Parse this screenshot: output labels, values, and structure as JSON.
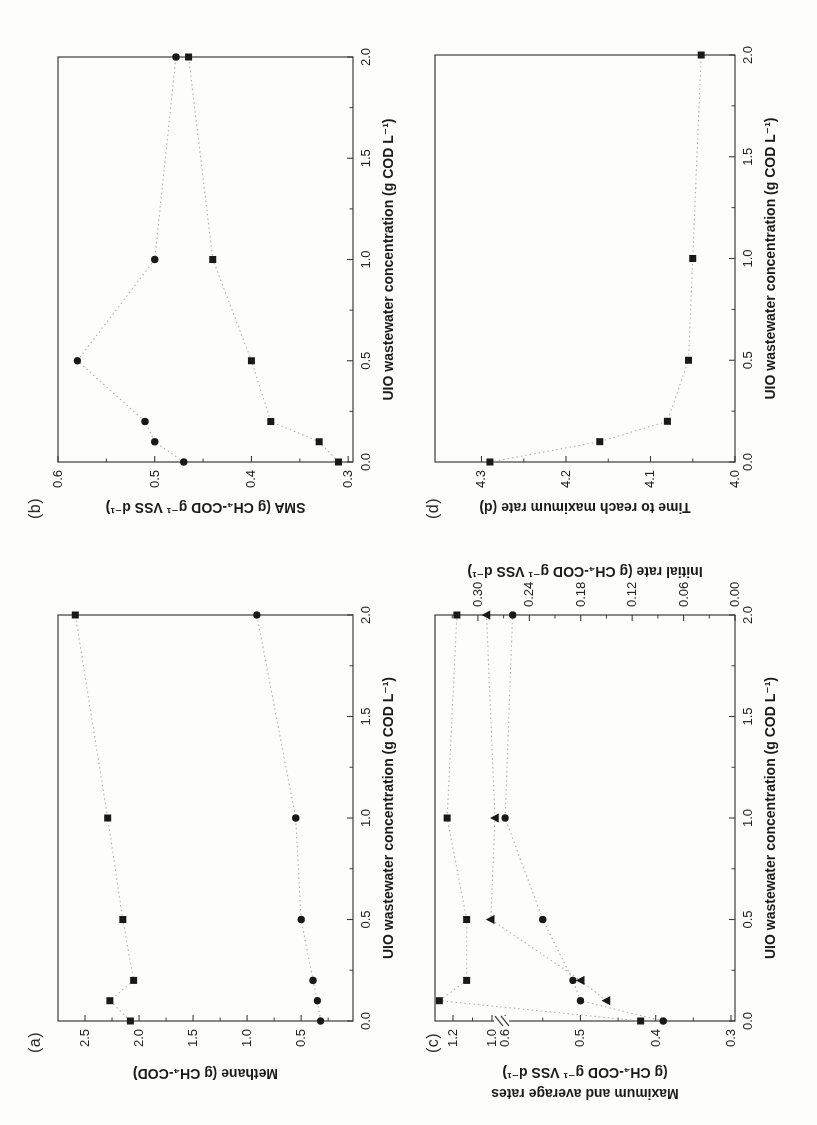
{
  "figure": {
    "kind": "scanned four-panel scatter figure, rotated 90 degrees on page",
    "ink_color": "#1f1f1f",
    "frame_color": "#3c3c3c",
    "trend_color": "#aeaeae"
  },
  "chart_data": [
    {
      "panel_label": "(a)",
      "type": "scatter",
      "xlabel": "UIO wastewater concentration (g COD L⁻¹)",
      "ylabel": "Methane (g CH₄-COD)",
      "xlim": [
        0.0,
        2.0
      ],
      "ylim": [
        0.02,
        2.75
      ],
      "grid": false,
      "legend": "none",
      "x_ticks": {
        "values": [
          0.0,
          0.5,
          1.0,
          1.5,
          2.0
        ],
        "labels": [
          "0.0",
          "0.5",
          "1.0",
          "1.5",
          "2.0"
        ],
        "minor": [
          0.25,
          0.75,
          1.25,
          1.75
        ]
      },
      "y_ticks": {
        "values": [
          0.5,
          1.0,
          1.5,
          2.0,
          2.5
        ],
        "labels": [
          "0.5",
          "1.0",
          "1.5",
          "2.0",
          "2.5"
        ],
        "minor": [
          0.25,
          0.75,
          1.25,
          1.75,
          2.25
        ]
      },
      "series": [
        {
          "name": "filled squares",
          "marker": "square",
          "axis": "left",
          "trend": "dotted",
          "x": [
            0.0,
            0.1,
            0.2,
            0.5,
            1.0,
            2.0
          ],
          "y": [
            2.08,
            2.27,
            2.05,
            2.15,
            2.29,
            2.59
          ]
        },
        {
          "name": "filled circles",
          "marker": "circle",
          "axis": "left",
          "trend": "dotted",
          "x": [
            0.0,
            0.1,
            0.2,
            0.5,
            1.0,
            2.0
          ],
          "y": [
            0.32,
            0.35,
            0.39,
            0.5,
            0.55,
            0.91
          ]
        }
      ]
    },
    {
      "panel_label": "(b)",
      "type": "scatter",
      "xlabel": "UIO wastewater concentration (g COD L⁻¹)",
      "ylabel": "SMA (g CH₄-COD g⁻¹ VSS d⁻¹)",
      "xlim": [
        0.0,
        2.0
      ],
      "ylim": [
        0.295,
        0.6
      ],
      "grid": false,
      "legend": "none",
      "x_ticks": {
        "values": [
          0.0,
          0.5,
          1.0,
          1.5,
          2.0
        ],
        "labels": [
          "0.0",
          "0.5",
          "1.0",
          "1.5",
          "2.0"
        ],
        "minor": [
          0.25,
          0.75,
          1.25,
          1.75
        ]
      },
      "y_ticks": {
        "values": [
          0.3,
          0.4,
          0.5,
          0.6
        ],
        "labels": [
          "0.3",
          "0.4",
          "0.5",
          "0.6"
        ],
        "minor": [
          0.35,
          0.45,
          0.55
        ]
      },
      "series": [
        {
          "name": "filled circles",
          "marker": "circle",
          "axis": "left",
          "trend": "dotted",
          "x": [
            0.0,
            0.1,
            0.2,
            0.5,
            1.0,
            2.0
          ],
          "y": [
            0.47,
            0.5,
            0.51,
            0.58,
            0.5,
            0.478
          ]
        },
        {
          "name": "filled squares",
          "marker": "square",
          "axis": "left",
          "trend": "dotted",
          "x": [
            0.0,
            0.1,
            0.2,
            0.5,
            1.0,
            2.0
          ],
          "y": [
            0.31,
            0.33,
            0.38,
            0.4,
            0.44,
            0.465
          ]
        }
      ]
    },
    {
      "panel_label": "(c)",
      "type": "scatter",
      "xlabel": "UIO wastewater concentration (g COD L⁻¹)",
      "ylabel_left_lines": [
        "Maximum and average rates",
        "(g CH₄-COD g⁻¹ VSS d⁻¹)"
      ],
      "ylabel_right": "Initial rate (g CH₄-COD g⁻¹ VSS d⁻¹)",
      "xlim": [
        0.0,
        2.0
      ],
      "ylim_left": [
        0.295,
        1.29
      ],
      "axis_break_left": [
        0.65,
        1.0
      ],
      "ylim_right": [
        0.0,
        0.35
      ],
      "grid": false,
      "legend": "none",
      "x_ticks": {
        "values": [
          0.0,
          0.5,
          1.0,
          1.5,
          2.0
        ],
        "labels": [
          "0.0",
          "0.5",
          "1.0",
          "1.5",
          "2.0"
        ],
        "minor": [
          0.25,
          0.75,
          1.25,
          1.75
        ]
      },
      "y_ticks": {
        "values": [
          0.3,
          0.4,
          0.5,
          0.6,
          1.0,
          1.2
        ],
        "labels": [
          "0.3",
          "0.4",
          "0.5",
          "0.6",
          "1.0",
          "1.2"
        ],
        "minor": [
          0.35,
          0.45,
          0.55,
          1.1
        ]
      },
      "y2_ticks": {
        "values": [
          0.0,
          0.06,
          0.12,
          0.18,
          0.24,
          0.3
        ],
        "labels": [
          "0.00",
          "0.06",
          "0.12",
          "0.18",
          "0.24",
          "0.30"
        ],
        "minor": [
          0.03,
          0.09,
          0.15,
          0.21,
          0.27,
          0.33
        ]
      },
      "series": [
        {
          "name": "maximum rate (filled squares)",
          "marker": "square",
          "axis": "left",
          "trend": "dotted",
          "x": [
            0.0,
            0.1,
            0.2,
            0.5,
            1.0,
            2.0
          ],
          "y": [
            0.42,
            1.27,
            1.13,
            1.13,
            1.23,
            1.18
          ]
        },
        {
          "name": "average rate (filled circles)",
          "marker": "circle",
          "axis": "left",
          "trend": "dotted",
          "x": [
            0.0,
            0.1,
            0.2,
            0.5,
            1.0,
            2.0
          ],
          "y": [
            0.39,
            0.5,
            0.51,
            0.55,
            0.6,
            0.59
          ]
        },
        {
          "name": "initial rate (filled triangles)",
          "marker": "triangle",
          "axis": "right",
          "trend": "dotted",
          "x": [
            0.1,
            0.2,
            0.5,
            1.0,
            2.0
          ],
          "y": [
            0.15,
            0.18,
            0.285,
            0.28,
            0.29
          ]
        }
      ]
    },
    {
      "panel_label": "(d)",
      "type": "scatter",
      "xlabel": "UIO wastewater concentration (g COD L⁻¹)",
      "ylabel": "Time to reach maximum rate (d)",
      "xlim": [
        0.0,
        2.0
      ],
      "ylim": [
        4.0,
        4.355
      ],
      "grid": false,
      "legend": "none",
      "x_ticks": {
        "values": [
          0.0,
          0.5,
          1.0,
          1.5,
          2.0
        ],
        "labels": [
          "0.0",
          "0.5",
          "1.0",
          "1.5",
          "2.0"
        ],
        "minor": [
          0.25,
          0.75,
          1.25,
          1.75
        ]
      },
      "y_ticks": {
        "values": [
          4.0,
          4.1,
          4.2,
          4.3
        ],
        "labels": [
          "4.0",
          "4.1",
          "4.2",
          "4.3"
        ],
        "minor": [
          4.05,
          4.15,
          4.25
        ]
      },
      "series": [
        {
          "name": "filled squares",
          "marker": "square",
          "axis": "left",
          "trend": "dotted",
          "x": [
            0.0,
            0.1,
            0.2,
            0.5,
            1.0,
            2.0
          ],
          "y": [
            4.29,
            4.16,
            4.08,
            4.055,
            4.05,
            4.04
          ]
        }
      ]
    }
  ]
}
